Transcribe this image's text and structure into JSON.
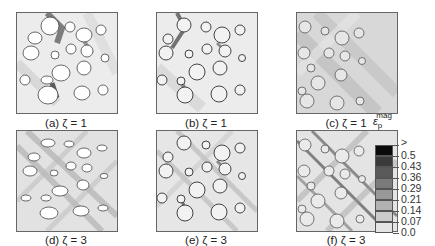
{
  "figure": {
    "panels": [
      {
        "id": "a",
        "caption": "(a) ζ = 1",
        "x": 16,
        "y": 12,
        "style": "voids-large"
      },
      {
        "id": "b",
        "caption": "(b) ζ = 1",
        "x": 156,
        "y": 12,
        "style": "rings"
      },
      {
        "id": "c",
        "caption": "(c) ζ = 1",
        "x": 296,
        "y": 12,
        "style": "diffuse"
      },
      {
        "id": "d",
        "caption": "(d) ζ = 3",
        "x": 16,
        "y": 130,
        "style": "voids-ellipse"
      },
      {
        "id": "e",
        "caption": "(e) ζ = 3",
        "x": 156,
        "y": 130,
        "style": "rings"
      },
      {
        "id": "f",
        "caption": "(f) ζ = 3",
        "x": 296,
        "y": 130,
        "style": "bands"
      }
    ],
    "legend": {
      "symbol": "ε",
      "subscript": "p",
      "superscript": "mag",
      "labels": [
        ">",
        "0.5",
        "0.43",
        "0.36",
        "0.29",
        "0.21",
        "0.14",
        "0.07",
        "0.0"
      ],
      "colors": [
        "#0a0a0a",
        "#3a3a3a",
        "#5a5a5a",
        "#7a7a7a",
        "#989898",
        "#b2b2b2",
        "#cbcbcb",
        "#e4e4e4"
      ]
    }
  }
}
